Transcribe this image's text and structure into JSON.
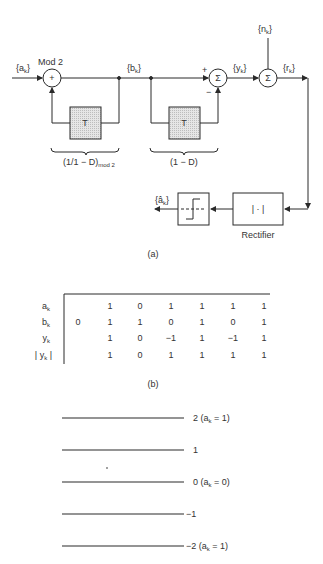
{
  "figure_a": {
    "caption": "(a)",
    "input_label": "{a",
    "input_sub": "k",
    "mod2_label": "Mod 2",
    "adder_symbol": "+",
    "delay1_label": "T",
    "delay2_label": "T",
    "precoder_label": "(1/1 − D)",
    "precoder_sub": "mod 2",
    "encoder_label": "(1 − D)",
    "b_label": "{b",
    "b_sub": "k",
    "sum1_symbol": "Σ",
    "plus_sign": "+",
    "minus_sign": "−",
    "y_label": "{y",
    "y_sub": "k",
    "noise_label": "{n",
    "noise_sub": "k",
    "sum2_symbol": "Σ",
    "r_label": "{r",
    "r_sub": "k",
    "rectifier_symbol": "| · |",
    "rectifier_label": "Rectifier",
    "output_label": "{â",
    "output_sub": "k",
    "close_brace": "}"
  },
  "figure_b": {
    "caption": "(b)",
    "rows": [
      {
        "label": "a",
        "sub": "k",
        "values": [
          "",
          "1",
          "0",
          "1",
          "1",
          "1",
          "1"
        ]
      },
      {
        "label": "b",
        "sub": "k",
        "values": [
          "0",
          "1",
          "1",
          "0",
          "1",
          "0",
          "1"
        ]
      },
      {
        "label": "y",
        "sub": "k",
        "values": [
          "",
          "1",
          "0",
          "−1",
          "1",
          "−1",
          "1"
        ]
      },
      {
        "label": "| y",
        "sub": "k",
        "suffix": " |",
        "values": [
          "",
          "1",
          "0",
          "1",
          "1",
          "1",
          "1"
        ]
      }
    ]
  },
  "figure_c": {
    "levels": [
      {
        "value": "2 (a",
        "sub": "k",
        "tail": " = 1)"
      },
      {
        "value": "1",
        "sub": "",
        "tail": ""
      },
      {
        "value": "0 (a",
        "sub": "k",
        "tail": " = 0)"
      },
      {
        "value": "−1",
        "sub": "",
        "tail": ""
      },
      {
        "value": "−2 (a",
        "sub": "k",
        "tail": " = 1)"
      }
    ]
  }
}
